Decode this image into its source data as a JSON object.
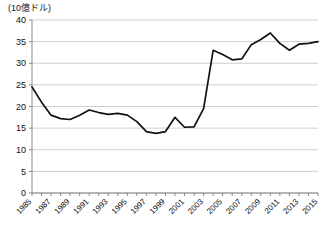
{
  "chart_data": {
    "type": "line",
    "title": "",
    "unit_label": "(10億ドル)",
    "xlabel": "",
    "ylabel": "",
    "ylim": [
      0,
      40
    ],
    "xlim": [
      1985,
      2015
    ],
    "yticks": [
      0,
      5,
      10,
      15,
      20,
      25,
      30,
      35,
      40
    ],
    "xticks": [
      1985,
      1987,
      1989,
      1991,
      1993,
      1995,
      1997,
      1999,
      2001,
      2003,
      2005,
      2007,
      2009,
      2011,
      2013,
      2015
    ],
    "grid": "horizontal",
    "legend": "none",
    "xtick_rotation": 45,
    "line_color": "#111111",
    "grid_color": "#b9b9b9",
    "axis_color": "#6f6f6f",
    "background_color": "#ffffff",
    "x": [
      1985,
      1986,
      1987,
      1988,
      1989,
      1990,
      1991,
      1992,
      1993,
      1994,
      1995,
      1996,
      1997,
      1998,
      1999,
      2000,
      2001,
      2002,
      2003,
      2004,
      2005,
      2006,
      2007,
      2008,
      2009,
      2010,
      2011,
      2012,
      2013,
      2014,
      2015
    ],
    "values": [
      24.5,
      21.0,
      18.0,
      17.2,
      17.0,
      18.0,
      19.2,
      18.6,
      18.2,
      18.4,
      18.0,
      16.5,
      14.2,
      13.8,
      14.2,
      17.5,
      15.2,
      15.3,
      19.5,
      33.0,
      32.0,
      30.8,
      31.0,
      34.3,
      35.5,
      37.0,
      34.6,
      33.0,
      34.4,
      34.6,
      35.0
    ]
  }
}
